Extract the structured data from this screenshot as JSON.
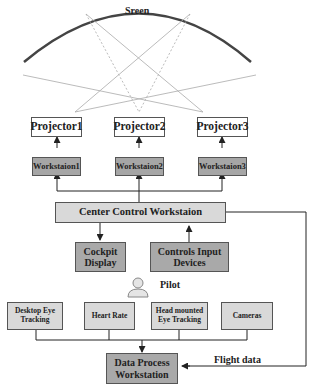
{
  "screen": {
    "label": "Sreen"
  },
  "projectors": [
    {
      "label": "Projector1"
    },
    {
      "label": "Projector2"
    },
    {
      "label": "Projector3"
    }
  ],
  "workstations": [
    {
      "label": "Workstaion1"
    },
    {
      "label": "Workstaion2"
    },
    {
      "label": "Workstaion3"
    }
  ],
  "center": {
    "label": "Center Control Workstaion"
  },
  "cockpit": {
    "label": "Cockpit Display"
  },
  "controls": {
    "label": "Controls Input Devices"
  },
  "pilot": {
    "label": "Pilot",
    "icon": "person-icon"
  },
  "sensors": [
    {
      "label": "Desktop Eye Tracking"
    },
    {
      "label": "Heart Rate"
    },
    {
      "label": "Head mounted Eye Tracking"
    },
    {
      "label": "Cameras"
    }
  ],
  "data_process": {
    "label": "Data Process Workstation"
  },
  "flight_data": {
    "label": "Flight data"
  },
  "colors": {
    "dark_box": "#a9a9a9",
    "light_box": "#d9d9d9",
    "screen_arc": "#444444",
    "lines": "#333333"
  }
}
